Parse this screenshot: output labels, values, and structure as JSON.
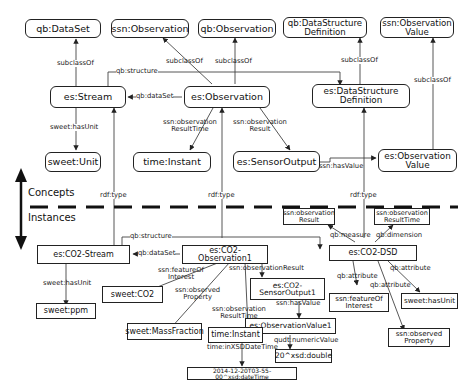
{
  "layers": {
    "concepts": "Concepts",
    "instances": "Instances"
  },
  "concept_nodes": {
    "qb_dataset": "qb:DataSet",
    "ssn_observation": "ssn:Observation",
    "qb_observation": "qb:Observation",
    "qb_dsd": "qb:DataStructure\nDefinition",
    "ssn_obs_value": "ssn:Observation\nValue",
    "es_stream": "es:Stream",
    "es_observation": "es:Observation",
    "es_dsd": "es:DataStructure\nDefinition",
    "sweet_unit": "sweet:Unit",
    "time_instant": "time:Instant",
    "es_sensor_output": "es:SensorOutput",
    "es_obs_value": "es:Observation\nValue"
  },
  "instance_nodes": {
    "co2_stream": "es:CO2-Stream",
    "co2_observation1": "es:CO2-Observation1",
    "co2_dsd": "es:CO2-DSD",
    "dsd_obs_result": "ssn:observation\nResult",
    "dsd_obs_result_time": "ssn:observation\nResultTime",
    "sweet_ppm": "sweet:ppm",
    "sweet_co2": "sweet:CO2",
    "sweet_mass_fraction": "sweet:MassFraction",
    "co2_sensor_output1": "es:CO2-\nSensorOutput1",
    "obs_value1": "es:ObservationValue1",
    "time_instant_i": "time:Instant",
    "value_double": "20^xsd:double",
    "datetime": "2014-12-20T03-55-00^xsd:dateTime",
    "ssn_feature_of_interest": "ssn:featureOf\nInterest",
    "sweet_has_unit": "sweet:hasUnit",
    "ssn_observed_property": "ssn:observed\nProperty"
  },
  "edge_labels": {
    "subclass_dataset": "subclassOf",
    "subclass_ssn_obs": "subclassOf",
    "subclass_qb_obs": "subclassOf",
    "subclass_dsd": "subclassOf",
    "subclass_obs_value": "subclassOf",
    "qb_structure_top": "qb:structure",
    "qb_dataset_top": "qb:dataSet",
    "sweet_has_unit_top": "sweet:hasUnit",
    "ssn_obs_result_time_top": "ssn:observation\nResultTime",
    "ssn_obs_result_top": "ssn:observation\nResult",
    "ssn_has_value_top": "ssn:hasValue",
    "rdf_type_stream": "rdf:type",
    "rdf_type_obs": "rdf:type",
    "rdf_type_dsd": "rdf:type",
    "qb_structure_bottom": "qb:structure",
    "qb_dataset_bottom": "qb:dataSet",
    "sweet_has_unit_bottom": "sweet:hasUnit",
    "ssn_feature_of_interest": "ssn:featureOf\nInterest",
    "ssn_observed_property": "ssn:observed\nProperty",
    "ssn_obs_result_time_bottom": "ssn:observation\nResultTime",
    "ssn_obs_result_bottom": "ssn:observationResult",
    "ssn_has_value_bottom": "ssn:hasValue",
    "time_in_xsd": "time:inXSDDateTime",
    "qudt_numeric_value": "qudt:numericValue",
    "qb_measure": "qb:measure",
    "qb_dimension": "qb:dimension",
    "qb_attribute_1": "qb:attribute",
    "qb_attribute_2": "qb:attribute",
    "qb_attribute_3": "qb:attribute"
  },
  "colors": {
    "line": "#333333",
    "text": "#111111",
    "background": "#ffffff"
  }
}
